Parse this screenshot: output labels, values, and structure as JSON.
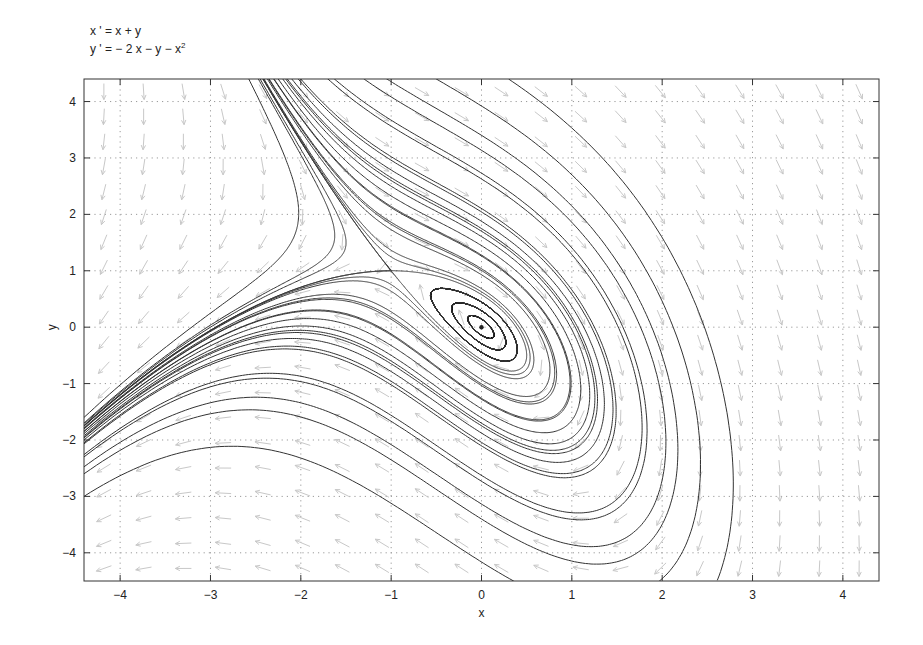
{
  "equations": {
    "x_prime": "x ' = x + y",
    "y_prime_main": "y ' = − 2 x − y − x",
    "y_prime_sup": "2"
  },
  "chart_data": {
    "type": "phase-portrait",
    "system": {
      "dx": "x + y",
      "dy": "-2*x - y - x^2"
    },
    "xlabel": "x",
    "ylabel": "y",
    "xlim": [
      -4.4,
      4.4
    ],
    "ylim": [
      -4.5,
      4.4
    ],
    "xticks": [
      -4,
      -3,
      -2,
      -1,
      0,
      1,
      2,
      3,
      4
    ],
    "yticks": [
      -4,
      -3,
      -2,
      -1,
      0,
      1,
      2,
      3,
      4
    ],
    "xtick_labels": [
      "−4",
      "−3",
      "−2",
      "−1",
      "0",
      "1",
      "2",
      "3",
      "4"
    ],
    "ytick_labels": [
      "−4",
      "−3",
      "−2",
      "−1",
      "0",
      "1",
      "2",
      "3",
      "4"
    ],
    "grid": "dotted",
    "equilibria": [
      {
        "x": 0,
        "y": 0,
        "type": "stable spiral"
      },
      {
        "x": -1,
        "y": 1,
        "type": "saddle"
      }
    ],
    "trajectory_seeds": [
      [
        -2.45,
        4.4
      ],
      [
        -2.35,
        4.4
      ],
      [
        -2.3,
        4.4
      ],
      [
        -2.25,
        4.4
      ],
      [
        -2.2,
        4.4
      ],
      [
        -2.15,
        4.4
      ],
      [
        -2.1,
        4.4
      ],
      [
        -2.0,
        4.4
      ],
      [
        -1.7,
        4.4
      ],
      [
        -1.3,
        4.4
      ],
      [
        -0.5,
        4.4
      ],
      [
        0.3,
        4.4
      ],
      [
        -4.4,
        -1.6
      ],
      [
        -4.4,
        -1.7
      ],
      [
        -4.4,
        -1.75
      ],
      [
        -4.4,
        -1.8
      ],
      [
        -4.4,
        -1.85
      ],
      [
        -4.4,
        -1.95
      ],
      [
        -4.4,
        -2.05
      ],
      [
        -4.4,
        -2.3
      ],
      [
        -4.4,
        -2.6
      ],
      [
        -4.4,
        -3.0
      ],
      [
        -1.05,
        1.0
      ],
      [
        -0.95,
        1.0
      ],
      [
        0.6,
        0.0
      ],
      [
        0.45,
        0.0
      ],
      [
        0.3,
        0.0
      ],
      [
        0.2,
        0.0
      ],
      [
        0.1,
        0.0
      ]
    ],
    "field_grid": {
      "nx": 20,
      "ny": 20
    },
    "colors": {
      "trajectory": "#333333",
      "arrows": "#c8c8c8",
      "grid": "#9a9a9a",
      "axis": "#333333"
    }
  }
}
